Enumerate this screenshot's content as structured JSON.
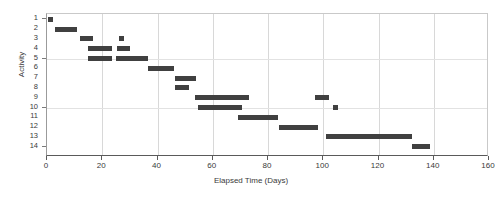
{
  "chart_data": {
    "type": "bar",
    "orientation": "horizontal",
    "subtype": "gantt",
    "title": "",
    "xlabel": "Elapsed Time (Days)",
    "ylabel": "Activity",
    "xlim": [
      0,
      160
    ],
    "ylim": [
      1,
      14
    ],
    "xticks": [
      0,
      20,
      40,
      60,
      80,
      100,
      120,
      140,
      160
    ],
    "xtick_labels": [
      "0",
      "20",
      "40",
      "60",
      "80",
      "100",
      "120",
      "140",
      "160"
    ],
    "yticks": [
      1,
      2,
      3,
      4,
      5,
      6,
      7,
      8,
      9,
      10,
      11,
      12,
      13,
      14
    ],
    "ytick_labels": [
      "1",
      "2",
      "3",
      "4",
      "5",
      "6",
      "7",
      "8",
      "9",
      "10",
      "11",
      "12",
      "13",
      "14"
    ],
    "y_major_ticks": [
      1,
      5,
      10,
      14
    ],
    "grid": {
      "vertical": true,
      "horizontal": true,
      "horizontal_at": [
        5,
        10
      ]
    },
    "legend": null,
    "bar_color": "#404040",
    "categories": [
      "1",
      "2",
      "3",
      "4",
      "5",
      "6",
      "7",
      "8",
      "9",
      "10",
      "11",
      "12",
      "13",
      "14"
    ],
    "tasks": [
      {
        "activity": 1,
        "segments": [
          {
            "start": 0.5,
            "end": 2.0
          }
        ]
      },
      {
        "activity": 2,
        "segments": [
          {
            "start": 3.0,
            "end": 11.0
          }
        ]
      },
      {
        "activity": 3,
        "segments": [
          {
            "start": 12.0,
            "end": 16.5
          },
          {
            "start": 26.0,
            "end": 28.0
          }
        ]
      },
      {
        "activity": 4,
        "segments": [
          {
            "start": 15.0,
            "end": 23.5
          },
          {
            "start": 25.5,
            "end": 30.0
          }
        ]
      },
      {
        "activity": 5,
        "segments": [
          {
            "start": 15.0,
            "end": 23.5
          },
          {
            "start": 25.0,
            "end": 36.5
          }
        ]
      },
      {
        "activity": 6,
        "segments": [
          {
            "start": 36.5,
            "end": 46.0
          }
        ]
      },
      {
        "activity": 7,
        "segments": [
          {
            "start": 46.5,
            "end": 54.0
          }
        ]
      },
      {
        "activity": 8,
        "segments": [
          {
            "start": 46.5,
            "end": 51.5
          }
        ]
      },
      {
        "activity": 9,
        "segments": [
          {
            "start": 53.5,
            "end": 73.0
          },
          {
            "start": 97.0,
            "end": 102.0
          }
        ]
      },
      {
        "activity": 10,
        "segments": [
          {
            "start": 54.5,
            "end": 70.5
          },
          {
            "start": 103.5,
            "end": 105.5
          }
        ]
      },
      {
        "activity": 11,
        "segments": [
          {
            "start": 69.0,
            "end": 83.5
          }
        ]
      },
      {
        "activity": 12,
        "segments": [
          {
            "start": 84.0,
            "end": 98.0
          }
        ]
      },
      {
        "activity": 13,
        "segments": [
          {
            "start": 101.0,
            "end": 132.0
          }
        ]
      },
      {
        "activity": 14,
        "segments": [
          {
            "start": 132.0,
            "end": 138.5
          }
        ]
      }
    ]
  }
}
